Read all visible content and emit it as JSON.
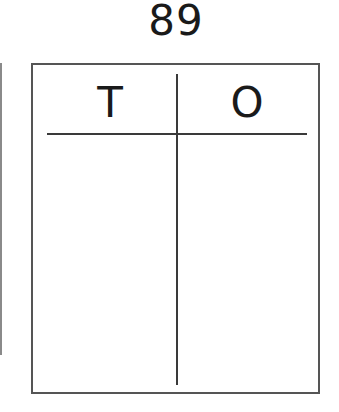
{
  "title": "89",
  "place_value_chart": {
    "columns": [
      {
        "label": "T",
        "meaning": "tens",
        "value": ""
      },
      {
        "label": "O",
        "meaning": "ones",
        "value": ""
      }
    ]
  },
  "colors": {
    "line": "#3a3a3a",
    "border": "#555555",
    "text": "#1a1a1a",
    "background": "#ffffff"
  }
}
